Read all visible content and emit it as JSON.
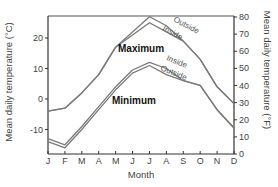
{
  "chart_data": {
    "type": "line",
    "title": "",
    "xlabel": "Month",
    "ylabel_left": "Mean daily temperature (°C)",
    "ylabel_right": "Mean daily temperature (°F)",
    "categories": [
      "J",
      "F",
      "M",
      "A",
      "M",
      "J",
      "J",
      "A",
      "S",
      "O",
      "N",
      "D"
    ],
    "ylim_c": [
      -17,
      28
    ],
    "yticks_c": [
      20,
      10,
      0,
      -10
    ],
    "yticks_f": [
      80,
      70,
      60,
      50,
      40,
      30,
      20,
      10,
      0
    ],
    "ylim_f": [
      0,
      80
    ],
    "groups": [
      {
        "name": "Maximum",
        "label_pos": {
          "x": 118,
          "y": 52
        }
      },
      {
        "name": "Minimum",
        "label_pos": {
          "x": 112,
          "y": 104
        }
      }
    ],
    "series": [
      {
        "name": "Outside",
        "group": "Maximum",
        "values": [
          -4,
          -3,
          2,
          8,
          17,
          22,
          27,
          24,
          19,
          13,
          4,
          -1.5
        ],
        "label_pos": {
          "x": 173,
          "y": 21,
          "rot": 28
        }
      },
      {
        "name": "Inside",
        "group": "Maximum",
        "values": [
          -4,
          -3,
          2,
          8,
          17,
          21,
          25,
          22,
          19,
          13,
          4,
          -1.5
        ],
        "label_pos": {
          "x": 162,
          "y": 30,
          "rot": 28
        }
      },
      {
        "name": "Inside",
        "group": "Minimum",
        "values": [
          -13,
          -15,
          -9,
          -2.5,
          4,
          9.5,
          12,
          10,
          6,
          4.5,
          -3.5,
          -9.5
        ],
        "label_pos": {
          "x": 166,
          "y": 60,
          "rot": 22
        }
      },
      {
        "name": "Outside",
        "group": "Minimum",
        "values": [
          -14,
          -16,
          -10,
          -3.5,
          3,
          8.5,
          11,
          8,
          6,
          4.5,
          -3.5,
          -9.5
        ],
        "label_pos": {
          "x": 160,
          "y": 70,
          "rot": 22
        }
      }
    ],
    "grid": false,
    "legend": "inline labels"
  },
  "axes": {
    "x_title": "Month",
    "left_title": "Mean daily temperature (°C)",
    "right_title": "Mean daily temperature (°F)"
  },
  "colors": {
    "line": "#7a7a7a",
    "axis": "#333333",
    "frame": "#555555"
  }
}
